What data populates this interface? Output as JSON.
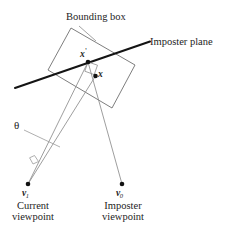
{
  "figure": {
    "width": 231,
    "height": 238,
    "background_color": "#ffffff",
    "stroke_color_thin": "#8a8a8a",
    "stroke_color_thick": "#1a1a1a",
    "point_color": "#111111"
  },
  "labels": {
    "bounding_box": "Bounding box",
    "imposter_plane": "Imposter plane",
    "x_prime": "x",
    "x_prime_mark": "'",
    "x": "x",
    "theta": "θ",
    "v1": "v",
    "v1_sub": "1",
    "v0": "v",
    "v0_sub": "0",
    "current_viewpoint_line1": "Current",
    "current_viewpoint_line2": "viewpoint",
    "imposter_viewpoint_line1": "Imposter",
    "imposter_viewpoint_line2": "viewpoint"
  },
  "geometry": {
    "bounding_box_vertices": "71,28 135,65 112,108 48,70",
    "imposter_plane_line": {
      "x1": 15,
      "y1": 88,
      "x2": 150,
      "y2": 42
    },
    "imposter_plane_leader": {
      "x1": 143,
      "y1": 45,
      "x2": 152,
      "y2": 41
    },
    "bounding_box_leader": "77,27 95,41",
    "theta_leader": "24,130 62,148",
    "point_x_prime": {
      "cx": 88,
      "cy": 62,
      "r": 2.2
    },
    "point_x": {
      "cx": 95,
      "cy": 76,
      "r": 2.2
    },
    "point_v1": {
      "cx": 28,
      "cy": 184,
      "r": 2.2
    },
    "point_v0": {
      "cx": 122,
      "cy": 184,
      "r": 2.2
    },
    "ray_v1_to_xprime": {
      "x1": 28,
      "y1": 184,
      "x2": 88,
      "y2": 62
    },
    "ray_v1_to_x": {
      "x1": 28,
      "y1": 184,
      "x2": 95,
      "y2": 76
    },
    "ray_v0_to_xprime": {
      "x1": 122,
      "y1": 184,
      "x2": 88,
      "y2": 62
    },
    "right_angle_marker": "88,62 97,65 94,74 85,71",
    "theta_angle_marker": "31,161 36,156 40,160 35,165"
  }
}
